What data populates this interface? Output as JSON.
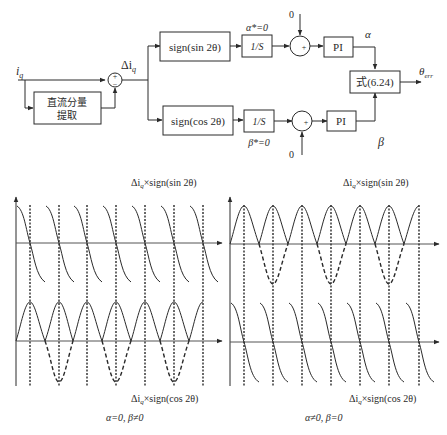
{
  "block_diagram": {
    "input_label": "i",
    "input_sub": "q",
    "dc_block_line1": "直流分量",
    "dc_block_line2": "提取",
    "sum1_plus": "+",
    "sum1_minus": "−",
    "delta_label": "Δi",
    "delta_sub": "q",
    "sign_sin_block": "sign(sin 2θ)",
    "sign_cos_block": "sign(cos 2θ)",
    "integrator_top": "1/S",
    "integrator_bottom": "1/S",
    "alpha_star": "α*=0",
    "beta_star": "β*=0",
    "zero_top": "0",
    "zero_bottom": "0",
    "sum_top_sign": "+",
    "sum_bottom_sign": "+",
    "pi_top": "PI",
    "pi_bottom": "PI",
    "alpha_label": "α",
    "beta_label": "β",
    "formula_block": "式(6.24)",
    "output_label": "θ",
    "output_sub": "err"
  },
  "waveforms": {
    "left": {
      "top_label": "Δi",
      "top_label_sub": "q",
      "top_label_rest": "×sign(sin 2θ)",
      "bottom_label": "Δi",
      "bottom_label_sub": "q",
      "bottom_label_rest": "×sign(cos 2θ)",
      "caption": "α=0, β≠0"
    },
    "right": {
      "top_label": "Δi",
      "top_label_sub": "q",
      "top_label_rest": "×sign(sin 2θ)",
      "bottom_label": "Δi",
      "bottom_label_sub": "q",
      "bottom_label_rest": "×sign(cos 2θ)",
      "caption": "α≠0, β=0"
    }
  },
  "colors": {
    "stroke": "#2a2a2a",
    "axis": "#555555",
    "background": "#ffffff"
  }
}
